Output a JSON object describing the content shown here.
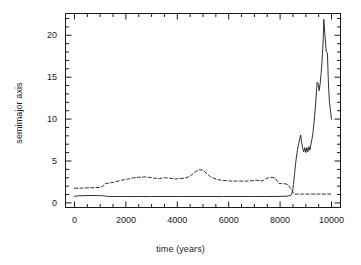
{
  "chart_data": {
    "type": "line",
    "title": "",
    "xlabel": "time (years)",
    "ylabel": "semimajor axis",
    "xlim": [
      -350,
      10350
    ],
    "ylim": [
      -0.55,
      22.6
    ],
    "xticks": [
      0,
      2000,
      4000,
      6000,
      8000,
      10000
    ],
    "xtick_labels": [
      "0",
      "2000",
      "4000",
      "6000",
      "8000",
      "10000"
    ],
    "yticks": [
      0,
      5,
      10,
      15,
      20
    ],
    "ytick_labels": [
      "0",
      "5",
      "10",
      "15",
      "20"
    ],
    "x_minor_interval": 500,
    "y_minor_interval": 1,
    "grid": false,
    "legend": "none",
    "frame": "box",
    "ticks_direction": "in",
    "ticks_all_sides": true,
    "series": [
      {
        "name": "inner body semimajor axis",
        "style": "solid",
        "color": "#1a1a1a",
        "x": [
          0,
          150,
          300,
          450,
          600,
          750,
          900,
          1050,
          1150,
          1250,
          1400,
          1600,
          1900,
          2200,
          2600,
          3000,
          3400,
          3800,
          4200,
          4600,
          5000,
          5400,
          5800,
          6200,
          6600,
          7000,
          7400,
          7800,
          8100,
          8300,
          8420,
          8480,
          8520,
          8560,
          8600,
          8640,
          8680,
          8720,
          8760,
          8800,
          8840,
          8880,
          8920,
          8960,
          9000,
          9040,
          9080,
          9120,
          9160,
          9200,
          9240,
          9280,
          9320,
          9360,
          9400,
          9440,
          9480,
          9520,
          9560,
          9600,
          9640,
          9680,
          9700,
          9740,
          9780,
          9800,
          9840,
          9880,
          9920,
          9960,
          10000
        ],
        "y": [
          0.78,
          0.85,
          0.86,
          0.87,
          0.88,
          0.88,
          0.87,
          0.86,
          0.84,
          0.78,
          0.76,
          0.76,
          0.76,
          0.76,
          0.76,
          0.76,
          0.76,
          0.76,
          0.76,
          0.76,
          0.76,
          0.76,
          0.76,
          0.76,
          0.76,
          0.76,
          0.76,
          0.77,
          0.78,
          0.82,
          0.9,
          1.3,
          2.2,
          3.4,
          4.6,
          5.6,
          6.4,
          7.0,
          7.6,
          8.1,
          7.2,
          6.5,
          6.1,
          6.6,
          6.0,
          6.6,
          6.1,
          6.7,
          6.3,
          7.0,
          7.6,
          8.4,
          9.6,
          11.0,
          12.6,
          14.4,
          14.2,
          13.4,
          14.3,
          15.6,
          17.3,
          19.6,
          21.9,
          20.2,
          18.6,
          18.0,
          17.9,
          14.3,
          12.0,
          11.0,
          10.0
        ]
      },
      {
        "name": "outer body semimajor axis",
        "style": "dashed",
        "color": "#1a1a1a",
        "x": [
          0,
          200,
          400,
          600,
          800,
          1000,
          1100,
          1200,
          1300,
          1500,
          1700,
          1900,
          2100,
          2300,
          2500,
          2700,
          2900,
          3100,
          3300,
          3500,
          3700,
          3900,
          4100,
          4300,
          4500,
          4700,
          4850,
          5000,
          5150,
          5300,
          5500,
          5700,
          5900,
          6100,
          6300,
          6500,
          6700,
          6900,
          7100,
          7300,
          7500,
          7650,
          7800,
          7950,
          8050,
          8150,
          8300,
          8450,
          8520,
          8560,
          8620,
          8700,
          8900,
          9200,
          9500,
          9800,
          10000
        ],
        "y": [
          1.75,
          1.76,
          1.78,
          1.8,
          1.82,
          1.85,
          2.0,
          2.3,
          2.35,
          2.45,
          2.6,
          2.75,
          2.85,
          3.0,
          3.05,
          3.1,
          3.05,
          2.95,
          2.9,
          3.0,
          2.95,
          2.85,
          2.9,
          2.95,
          3.2,
          3.7,
          3.95,
          3.9,
          3.5,
          3.1,
          2.85,
          2.7,
          2.65,
          2.6,
          2.6,
          2.6,
          2.6,
          2.65,
          2.7,
          2.6,
          2.95,
          3.05,
          3.0,
          2.35,
          2.3,
          2.3,
          2.2,
          1.55,
          1.15,
          1.05,
          1.05,
          1.05,
          1.05,
          1.05,
          1.05,
          1.05,
          1.05
        ]
      }
    ]
  }
}
